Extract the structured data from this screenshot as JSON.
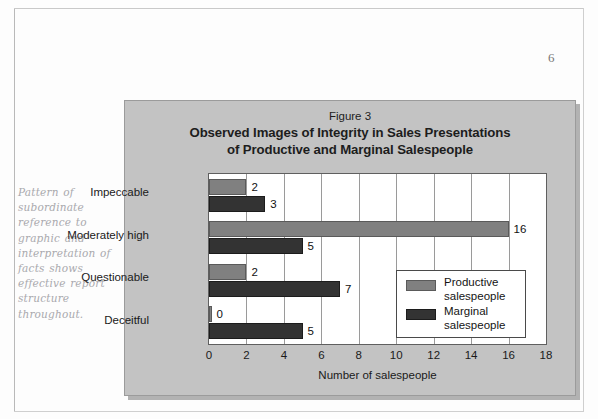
{
  "page": {
    "number": "6",
    "margin_note": "Pattern of subordinate reference to graphic and interpretation of facts shows effective report structure throughout."
  },
  "figure": {
    "caption_label": "Figure 3",
    "title_line_1": "Observed Images of Integrity in Sales Presentations",
    "title_line_2": "of Productive and Marginal Salespeople"
  },
  "colors": {
    "productive": "#808080",
    "marginal": "#333333",
    "panel": "#c3c3c3",
    "plot": "#ffffff"
  },
  "chart_data": {
    "type": "bar",
    "orientation": "horizontal",
    "title": "Figure 3 Observed Images of Integrity in Sales Presentations of Productive and Marginal Salespeople",
    "xlabel": "Number of salespeople",
    "ylabel": "",
    "categories": [
      "Impeccable",
      "Moderately high",
      "Questionable",
      "Deceitful"
    ],
    "series": [
      {
        "name": "Productive salespeople",
        "values": [
          2,
          16,
          2,
          0
        ],
        "color": "#808080"
      },
      {
        "name": "Marginal salespeople",
        "values": [
          3,
          5,
          7,
          5
        ],
        "color": "#333333"
      }
    ],
    "xlim": [
      0,
      18
    ],
    "xticks": [
      0,
      2,
      4,
      6,
      8,
      10,
      12,
      14,
      16,
      18
    ],
    "grid": true,
    "legend_position": "inside-bottom-right",
    "legend_entries": [
      "Productive salespeople",
      "Marginal salespeople"
    ]
  }
}
